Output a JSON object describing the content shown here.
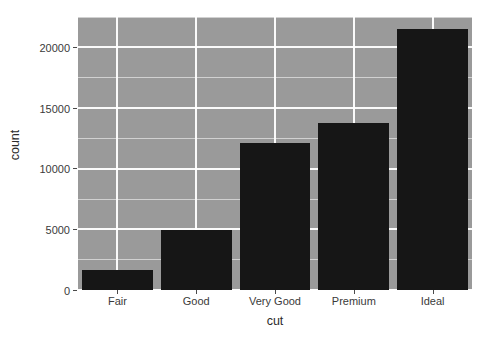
{
  "chart_data": {
    "type": "bar",
    "title": "",
    "subtitle": "",
    "xlabel": "cut",
    "ylabel": "count",
    "categories": [
      "Fair",
      "Good",
      "Very Good",
      "Premium",
      "Ideal"
    ],
    "values": [
      1610,
      4906,
      12082,
      13791,
      21551
    ],
    "ylim": [
      0,
      22500
    ],
    "xlim": [
      0,
      5
    ],
    "y_ticks": [
      0,
      5000,
      10000,
      15000,
      20000
    ],
    "y_tick_labels": [
      "0",
      "5000",
      "10000",
      "15000",
      "20000"
    ],
    "y_minor_ticks": [
      2500,
      7500,
      12500,
      17500,
      22500
    ],
    "grid": "major-and-minor",
    "legend": "none",
    "series": [
      {
        "name": "count",
        "values": [
          1610,
          4906,
          12082,
          13791,
          21551
        ]
      }
    ],
    "annotations": []
  },
  "style": {
    "panel_background": "#9a9a9a",
    "grid_color": "#ffffff",
    "bar_color": "#161616",
    "plot_background": "#ffffff",
    "text_color": "#3a3a3a",
    "axis_title_color": "#2b2b2b",
    "bar_width_ratio": 0.9
  }
}
